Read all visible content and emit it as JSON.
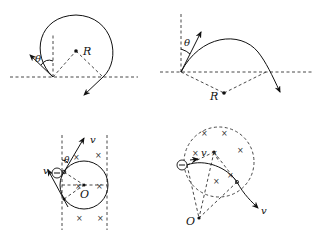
{
  "panels": [
    {
      "id": "top-left",
      "description": "Positive charge entering field, large arc exiting after more than a half circle",
      "labels": {
        "angle": "θ",
        "radius": "R"
      }
    },
    {
      "id": "top-right",
      "description": "Charge entering with angle θ from vertical, arcing over and exiting below boundary",
      "labels": {
        "angle": "θ",
        "radius": "R"
      }
    },
    {
      "id": "bottom-left",
      "description": "Negative charge in strip field between two dashed boundaries, circle centered at O",
      "labels": {
        "angle": "θ",
        "velocity_in": "v",
        "velocity_out": "v",
        "center": "O",
        "charge": "−"
      }
    },
    {
      "id": "bottom-right",
      "description": "Negative charge entering circular dashed field region, arc about center O outside",
      "labels": {
        "velocity_in": "v",
        "velocity_out": "v",
        "center": "O",
        "charge": "−"
      }
    }
  ],
  "field_symbol": "×"
}
